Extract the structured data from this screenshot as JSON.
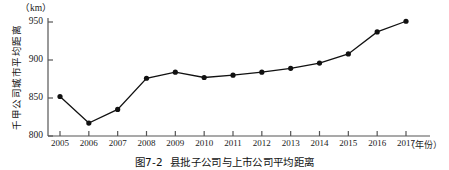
{
  "figure": {
    "unit_label": "（km）",
    "y_axis_title": "千甲公司城市平均距离",
    "x_axis_unit": "（年份）",
    "caption_number": "图7-2",
    "caption_text": "县批子公司与上市公司平均距离"
  },
  "chart_data": {
    "type": "line",
    "title": "县批子公司与上市公司平均距离",
    "xlabel": "（年份）",
    "ylabel": "千甲公司城市平均距离",
    "unit": "km",
    "categories": [
      "2005",
      "2006",
      "2007",
      "2008",
      "2009",
      "2010",
      "2011",
      "2012",
      "2013",
      "2014",
      "2015",
      "2016",
      "2017"
    ],
    "values": [
      852,
      817,
      835,
      876,
      884,
      877,
      880,
      884,
      889,
      896,
      908,
      937,
      951
    ],
    "ylim": [
      800,
      960
    ],
    "yticks": [
      800,
      850,
      900,
      950
    ],
    "ytick_labels": [
      "800",
      "850",
      "900",
      "950"
    ],
    "grid": false,
    "legend": "none",
    "marker": "filled-circle",
    "line_color": "#111111",
    "marker_color": "#111111"
  }
}
